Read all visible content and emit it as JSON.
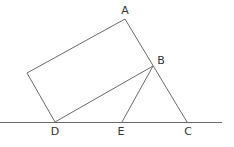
{
  "diagram": {
    "width": 234,
    "height": 147,
    "stroke_color": "#6a6a6a",
    "label_color": "#333333",
    "points": {
      "A": {
        "x": 125,
        "y": 19,
        "label": "A",
        "lx": 125,
        "ly": 14
      },
      "B": {
        "x": 153,
        "y": 66,
        "label": "B",
        "lx": 161,
        "ly": 64
      },
      "C": {
        "x": 187,
        "y": 122,
        "label": "C",
        "lx": 188,
        "ly": 135
      },
      "D": {
        "x": 55,
        "y": 122,
        "label": "D",
        "lx": 55,
        "ly": 135
      },
      "E": {
        "x": 122,
        "y": 122,
        "label": "E",
        "lx": 121,
        "ly": 135
      },
      "F": {
        "x": 27,
        "y": 73,
        "label": ""
      }
    },
    "segments": [
      {
        "name": "baseline",
        "from": [
          0,
          122
        ],
        "to": [
          222,
          122
        ]
      },
      {
        "name": "rect-side-AF",
        "from": "A",
        "to": "F"
      },
      {
        "name": "rect-side-FD",
        "from": "F",
        "to": "D"
      },
      {
        "name": "rect-side-DB",
        "from": "D",
        "to": "B"
      },
      {
        "name": "side-AC",
        "from": "A",
        "to": "C"
      },
      {
        "name": "segment-BE",
        "from": "B",
        "to": "E"
      }
    ],
    "labels": {
      "A": "A",
      "B": "B",
      "C": "C",
      "D": "D",
      "E": "E"
    }
  }
}
